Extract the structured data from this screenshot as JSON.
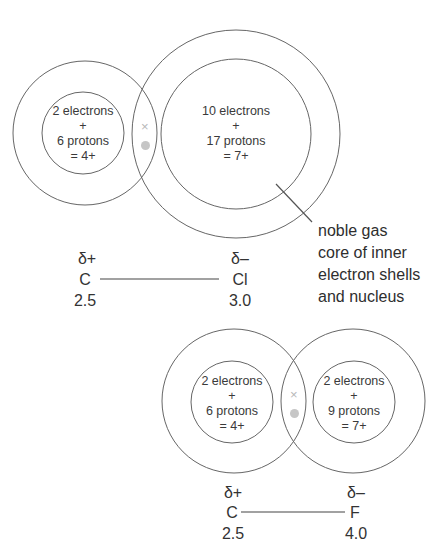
{
  "diagrams": [
    {
      "id": "C-Cl",
      "atoms": [
        {
          "symbol": "C",
          "partial_charge": "δ+",
          "electronegativity": "2.5",
          "core": {
            "line1": "2 electrons",
            "line2": "+",
            "line3": "6 protons",
            "line4": "= 4+"
          }
        },
        {
          "symbol": "Cl",
          "partial_charge": "δ–",
          "electronegativity": "3.0",
          "core": {
            "line1": "10 electrons",
            "line2": "+",
            "line3": "17 protons",
            "line4": "= 7+"
          }
        }
      ],
      "shared_pair": {
        "x_mark": "×",
        "dot": "●"
      }
    },
    {
      "id": "C-F",
      "atoms": [
        {
          "symbol": "C",
          "partial_charge": "δ+",
          "electronegativity": "2.5",
          "core": {
            "line1": "2 electrons",
            "line2": "+",
            "line3": "6 protons",
            "line4": "= 4+"
          }
        },
        {
          "symbol": "F",
          "partial_charge": "δ–",
          "electronegativity": "4.0",
          "core": {
            "line1": "2 electrons",
            "line2": "+",
            "line3": "9 protons",
            "line4": "= 7+"
          }
        }
      ],
      "shared_pair": {
        "x_mark": "×",
        "dot": "●"
      }
    }
  ],
  "annotation": {
    "line1": "noble gas",
    "line2": "core of inner",
    "line3": "electron shells",
    "line4": "and nucleus"
  },
  "colors": {
    "line": "#555555",
    "shared_pair": "#c0c0c0",
    "text": "#333333"
  }
}
